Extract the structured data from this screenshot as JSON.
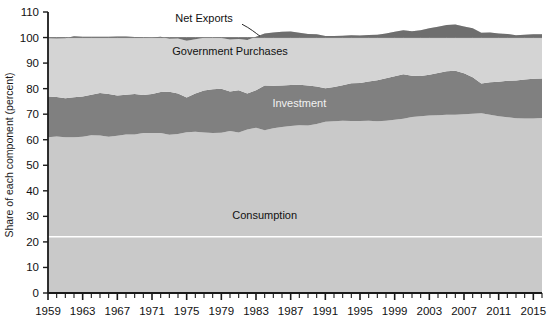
{
  "chart_data": {
    "type": "area",
    "stacked": true,
    "title": "",
    "subtitle": "",
    "xlabel": "",
    "ylabel": "Share of each component (percent)",
    "ylim": [
      0,
      110
    ],
    "xlim": [
      1959,
      2016
    ],
    "grid": false,
    "legend_position": "inline-annotations",
    "ytick_labels": [
      "0",
      "10",
      "20",
      "30",
      "40",
      "50",
      "60",
      "70",
      "80",
      "90",
      "100",
      "110"
    ],
    "yticks": [
      0,
      10,
      20,
      30,
      40,
      50,
      60,
      70,
      80,
      90,
      100,
      110
    ],
    "xtick_labels": [
      "1959",
      "1963",
      "1967",
      "1971",
      "1975",
      "1979",
      "1983",
      "1987",
      "1991",
      "1995",
      "1999",
      "2003",
      "2007",
      "2011",
      "2015"
    ],
    "xticks": [
      1959,
      1963,
      1967,
      1971,
      1975,
      1979,
      1983,
      1987,
      1991,
      1995,
      1999,
      2003,
      2007,
      2011,
      2015
    ],
    "xtick_minor_step": 1,
    "annotations": [
      {
        "text": "Net Exports",
        "x": 1977,
        "y": 106,
        "color": "#111111",
        "leader": true
      },
      {
        "text": "Government Purchases",
        "x": 1980,
        "y": 93,
        "color": "#111111",
        "leader": false
      },
      {
        "text": "Investment",
        "x": 1988,
        "y": 73,
        "color": "#f2f2f2",
        "leader": false
      },
      {
        "text": "Consumption",
        "x": 1984,
        "y": 29,
        "color": "#111111",
        "leader": false
      }
    ],
    "colors": {
      "consumption": "#c9c9c9",
      "investment": "#808080",
      "government": "#d4d4d4",
      "net_exports": "#6e6e6e",
      "axis": "#1a1a1a",
      "white_gridline": "#ffffff",
      "background": "#ffffff"
    },
    "x": [
      1959,
      1960,
      1961,
      1962,
      1963,
      1964,
      1965,
      1966,
      1967,
      1968,
      1969,
      1970,
      1971,
      1972,
      1973,
      1974,
      1975,
      1976,
      1977,
      1978,
      1979,
      1980,
      1981,
      1982,
      1983,
      1984,
      1985,
      1986,
      1987,
      1988,
      1989,
      1990,
      1991,
      1992,
      1993,
      1994,
      1995,
      1996,
      1997,
      1998,
      1999,
      2000,
      2001,
      2002,
      2003,
      2004,
      2005,
      2006,
      2007,
      2008,
      2009,
      2010,
      2011,
      2012,
      2013,
      2014,
      2015,
      2016
    ],
    "series": [
      {
        "name": "Consumption",
        "values": [
          61.0,
          61.3,
          61.0,
          61.0,
          61.2,
          61.8,
          61.7,
          61.2,
          61.6,
          62.0,
          62.0,
          62.6,
          62.6,
          62.6,
          61.9,
          62.2,
          62.9,
          63.1,
          62.8,
          62.6,
          62.7,
          63.4,
          62.8,
          64.0,
          64.7,
          63.7,
          64.5,
          65.0,
          65.4,
          65.7,
          65.6,
          66.2,
          67.0,
          67.2,
          67.4,
          67.3,
          67.3,
          67.4,
          67.2,
          67.4,
          67.8,
          68.2,
          68.9,
          69.2,
          69.5,
          69.6,
          69.8,
          69.8,
          70.0,
          70.2,
          70.4,
          69.8,
          69.2,
          68.8,
          68.4,
          68.3,
          68.3,
          68.5
        ]
      },
      {
        "name": "Investment",
        "values": [
          15.9,
          15.4,
          15.2,
          15.6,
          15.7,
          15.8,
          16.6,
          16.7,
          15.7,
          15.6,
          15.9,
          14.9,
          15.3,
          16.1,
          16.9,
          15.9,
          13.6,
          15.0,
          16.5,
          17.2,
          17.3,
          15.5,
          16.6,
          14.1,
          14.7,
          17.5,
          16.6,
          16.2,
          16.0,
          15.8,
          15.6,
          14.6,
          13.2,
          13.4,
          13.9,
          14.8,
          14.9,
          15.4,
          16.1,
          16.7,
          17.0,
          17.4,
          16.1,
          15.7,
          15.9,
          16.5,
          17.0,
          17.2,
          16.0,
          14.3,
          11.6,
          12.7,
          13.5,
          14.3,
          14.8,
          15.3,
          15.6,
          15.5
        ]
      },
      {
        "name": "Government Purchases",
        "values": [
          22.8,
          22.9,
          23.5,
          23.9,
          23.4,
          22.7,
          22.0,
          22.4,
          23.1,
          22.8,
          22.3,
          22.6,
          22.1,
          21.6,
          20.7,
          21.5,
          22.2,
          21.2,
          20.6,
          20.1,
          19.8,
          20.3,
          20.0,
          20.9,
          20.9,
          20.4,
          20.9,
          21.1,
          21.0,
          20.4,
          20.2,
          20.5,
          20.4,
          20.0,
          19.4,
          18.8,
          18.6,
          18.2,
          17.8,
          17.5,
          17.5,
          17.3,
          17.5,
          18.0,
          18.2,
          18.1,
          18.1,
          18.1,
          18.3,
          19.1,
          19.9,
          19.5,
          18.9,
          18.3,
          17.7,
          17.5,
          17.4,
          17.3
        ]
      },
      {
        "name": "Net Exports",
        "values": [
          0.3,
          0.4,
          0.3,
          -0.5,
          -0.3,
          -0.3,
          -0.3,
          -0.3,
          -0.4,
          -0.4,
          -0.2,
          -0.1,
          0.0,
          -0.3,
          0.5,
          0.4,
          1.3,
          0.7,
          0.1,
          0.1,
          0.2,
          0.8,
          0.6,
          1.0,
          -0.3,
          -1.6,
          -2.0,
          -2.3,
          -2.4,
          -1.9,
          -1.4,
          -1.3,
          -0.6,
          -0.6,
          -0.7,
          -0.9,
          -0.8,
          -1.0,
          -1.1,
          -1.6,
          -2.3,
          -2.9,
          -2.5,
          -2.9,
          -3.6,
          -4.2,
          -4.9,
          -5.1,
          -4.3,
          -3.6,
          -1.9,
          -2.0,
          -1.6,
          -1.4,
          -0.9,
          -1.1,
          -1.3,
          -1.3
        ]
      }
    ]
  },
  "labels": {
    "ylabel": "Share of each component (percent)",
    "net_exports": "Net Exports",
    "government_purchases": "Government Purchases",
    "investment": "Investment",
    "consumption": "Consumption"
  }
}
